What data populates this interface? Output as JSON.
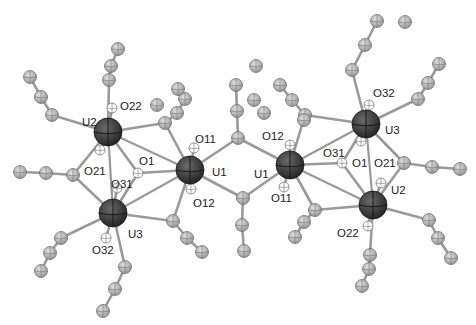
{
  "colors": {
    "uranium": "#3a3a3a",
    "carbon": "#b5b5b5",
    "oxygen": "#ffffff",
    "bond": "#9a9a9a",
    "label": "#222222"
  },
  "atoms": [
    {
      "id": "U2a",
      "el": "U",
      "x": 108,
      "y": 132
    },
    {
      "id": "U1a",
      "el": "U",
      "x": 190,
      "y": 170
    },
    {
      "id": "U3a",
      "el": "U",
      "x": 113,
      "y": 213
    },
    {
      "id": "U1b",
      "el": "U",
      "x": 290,
      "y": 165
    },
    {
      "id": "U3b",
      "el": "U",
      "x": 366,
      "y": 124
    },
    {
      "id": "U2b",
      "el": "U",
      "x": 373,
      "y": 205
    },
    {
      "id": "O1a",
      "el": "O",
      "x": 138,
      "y": 173
    },
    {
      "id": "O21a",
      "el": "O",
      "x": 100,
      "y": 150
    },
    {
      "id": "O22a",
      "el": "O",
      "x": 112,
      "y": 108
    },
    {
      "id": "O31a",
      "el": "O",
      "x": 117,
      "y": 188
    },
    {
      "id": "O32a",
      "el": "O",
      "x": 106,
      "y": 238
    },
    {
      "id": "O11a",
      "el": "O",
      "x": 194,
      "y": 148
    },
    {
      "id": "O12a",
      "el": "O",
      "x": 191,
      "y": 189
    },
    {
      "id": "O1b",
      "el": "O",
      "x": 342,
      "y": 163
    },
    {
      "id": "O31b",
      "el": "O",
      "x": 361,
      "y": 141
    },
    {
      "id": "O32b",
      "el": "O",
      "x": 369,
      "y": 105
    },
    {
      "id": "O21b",
      "el": "O",
      "x": 381,
      "y": 183
    },
    {
      "id": "O22b",
      "el": "O",
      "x": 368,
      "y": 226
    },
    {
      "id": "O11b",
      "el": "O",
      "x": 284,
      "y": 187
    },
    {
      "id": "O12b",
      "el": "O",
      "x": 290,
      "y": 145
    },
    {
      "id": "Cb1",
      "el": "C",
      "x": 238,
      "y": 138
    },
    {
      "id": "Cb2",
      "el": "C",
      "x": 237,
      "y": 111
    },
    {
      "id": "Cb3",
      "el": "C",
      "x": 236,
      "y": 85
    },
    {
      "id": "Cb4",
      "el": "C",
      "x": 243,
      "y": 198
    },
    {
      "id": "Cb5",
      "el": "C",
      "x": 242,
      "y": 225
    },
    {
      "id": "Cb6",
      "el": "C",
      "x": 244,
      "y": 251
    },
    {
      "id": "Ca1",
      "el": "C",
      "x": 52,
      "y": 115
    },
    {
      "id": "Ca2",
      "el": "C",
      "x": 41,
      "y": 97
    },
    {
      "id": "Ca3",
      "el": "C",
      "x": 30,
      "y": 77
    },
    {
      "id": "Ca4",
      "el": "C",
      "x": 109,
      "y": 80
    },
    {
      "id": "Ca5",
      "el": "C",
      "x": 111,
      "y": 66
    },
    {
      "id": "Ca6",
      "el": "C",
      "x": 118,
      "y": 49
    },
    {
      "id": "Ca7",
      "el": "C",
      "x": 165,
      "y": 123
    },
    {
      "id": "Ca8",
      "el": "C",
      "x": 177,
      "y": 113
    },
    {
      "id": "Ca9",
      "el": "C",
      "x": 185,
      "y": 99
    },
    {
      "id": "Ca10",
      "el": "C",
      "x": 73,
      "y": 175
    },
    {
      "id": "Ca11",
      "el": "C",
      "x": 46,
      "y": 173
    },
    {
      "id": "Ca12",
      "el": "C",
      "x": 20,
      "y": 172
    },
    {
      "id": "Ca13",
      "el": "C",
      "x": 61,
      "y": 238
    },
    {
      "id": "Ca14",
      "el": "C",
      "x": 50,
      "y": 253
    },
    {
      "id": "Ca15",
      "el": "C",
      "x": 41,
      "y": 271
    },
    {
      "id": "Ca16",
      "el": "C",
      "x": 125,
      "y": 267
    },
    {
      "id": "Ca17",
      "el": "C",
      "x": 115,
      "y": 289
    },
    {
      "id": "Ca18",
      "el": "C",
      "x": 103,
      "y": 311
    },
    {
      "id": "Ca19",
      "el": "C",
      "x": 173,
      "y": 221
    },
    {
      "id": "Ca20",
      "el": "C",
      "x": 187,
      "y": 238
    },
    {
      "id": "Ca21",
      "el": "C",
      "x": 202,
      "y": 252
    },
    {
      "id": "Ca22",
      "el": "C",
      "x": 157,
      "y": 105
    },
    {
      "id": "Ca23",
      "el": "C",
      "x": 178,
      "y": 89
    },
    {
      "id": "Cc1",
      "el": "C",
      "x": 305,
      "y": 115
    },
    {
      "id": "Cc2",
      "el": "C",
      "x": 292,
      "y": 100
    },
    {
      "id": "Cc3",
      "el": "C",
      "x": 280,
      "y": 85
    },
    {
      "id": "Cc4",
      "el": "C",
      "x": 352,
      "y": 70
    },
    {
      "id": "Cc5",
      "el": "C",
      "x": 365,
      "y": 45
    },
    {
      "id": "Cc6",
      "el": "C",
      "x": 377,
      "y": 21
    },
    {
      "id": "Cc7",
      "el": "C",
      "x": 418,
      "y": 99
    },
    {
      "id": "Cc8",
      "el": "C",
      "x": 428,
      "y": 83
    },
    {
      "id": "Cc9",
      "el": "C",
      "x": 439,
      "y": 64
    },
    {
      "id": "Cc10",
      "el": "C",
      "x": 404,
      "y": 163
    },
    {
      "id": "Cc11",
      "el": "C",
      "x": 432,
      "y": 167
    },
    {
      "id": "Cc12",
      "el": "C",
      "x": 460,
      "y": 169
    },
    {
      "id": "Cc13",
      "el": "C",
      "x": 429,
      "y": 220
    },
    {
      "id": "Cc14",
      "el": "C",
      "x": 438,
      "y": 238
    },
    {
      "id": "Cc15",
      "el": "C",
      "x": 451,
      "y": 258
    },
    {
      "id": "Cc16",
      "el": "C",
      "x": 370,
      "y": 255
    },
    {
      "id": "Cc17",
      "el": "C",
      "x": 369,
      "y": 269
    },
    {
      "id": "Cc18",
      "el": "C",
      "x": 362,
      "y": 286
    },
    {
      "id": "Cc19",
      "el": "C",
      "x": 315,
      "y": 210
    },
    {
      "id": "Cc20",
      "el": "C",
      "x": 304,
      "y": 222
    },
    {
      "id": "Cc21",
      "el": "C",
      "x": 295,
      "y": 237
    },
    {
      "id": "Cc22",
      "el": "C",
      "x": 304,
      "y": 120
    },
    {
      "id": "Cc23",
      "el": "C",
      "x": 254,
      "y": 100
    },
    {
      "id": "Cc24",
      "el": "C",
      "x": 264,
      "y": 113
    },
    {
      "id": "Cc25",
      "el": "C",
      "x": 256,
      "y": 66
    },
    {
      "id": "Cc26",
      "el": "C",
      "x": 405,
      "y": 22
    }
  ],
  "bonds": [
    [
      "U2a",
      "U1a"
    ],
    [
      "U2a",
      "U3a"
    ],
    [
      "U3a",
      "U1a"
    ],
    [
      "U2a",
      "O1a"
    ],
    [
      "U3a",
      "O1a"
    ],
    [
      "U1a",
      "O1a"
    ],
    [
      "U2a",
      "O21a"
    ],
    [
      "U2a",
      "O22a"
    ],
    [
      "U3a",
      "O31a"
    ],
    [
      "U3a",
      "O32a"
    ],
    [
      "U1a",
      "O11a"
    ],
    [
      "U1a",
      "O12a"
    ],
    [
      "U1a",
      "Cb1"
    ],
    [
      "Cb1",
      "U1b"
    ],
    [
      "U1a",
      "Cb4"
    ],
    [
      "Cb4",
      "U1b"
    ],
    [
      "Cb1",
      "Cb2"
    ],
    [
      "Cb2",
      "Cb3"
    ],
    [
      "Cb4",
      "Cb5"
    ],
    [
      "Cb5",
      "Cb6"
    ],
    [
      "U2a",
      "Ca1"
    ],
    [
      "Ca1",
      "Ca2"
    ],
    [
      "Ca2",
      "Ca3"
    ],
    [
      "U2a",
      "Ca4"
    ],
    [
      "Ca4",
      "Ca5"
    ],
    [
      "Ca5",
      "Ca6"
    ],
    [
      "U2a",
      "Ca7"
    ],
    [
      "Ca7",
      "U1a"
    ],
    [
      "Ca7",
      "Ca8"
    ],
    [
      "Ca8",
      "Ca9"
    ],
    [
      "U2a",
      "Ca10"
    ],
    [
      "U3a",
      "Ca10"
    ],
    [
      "Ca10",
      "Ca11"
    ],
    [
      "Ca11",
      "Ca12"
    ],
    [
      "U3a",
      "Ca13"
    ],
    [
      "Ca13",
      "Ca14"
    ],
    [
      "Ca14",
      "Ca15"
    ],
    [
      "U3a",
      "Ca16"
    ],
    [
      "Ca16",
      "Ca17"
    ],
    [
      "Ca17",
      "Ca18"
    ],
    [
      "U3a",
      "Ca19"
    ],
    [
      "Ca19",
      "U1a"
    ],
    [
      "Ca19",
      "Ca20"
    ],
    [
      "Ca20",
      "Ca21"
    ],
    [
      "U1b",
      "U3b"
    ],
    [
      "U1b",
      "U2b"
    ],
    [
      "U3b",
      "U2b"
    ],
    [
      "U1b",
      "O1b"
    ],
    [
      "U3b",
      "O1b"
    ],
    [
      "U2b",
      "O1b"
    ],
    [
      "U3b",
      "O31b"
    ],
    [
      "U3b",
      "O32b"
    ],
    [
      "U2b",
      "O21b"
    ],
    [
      "U2b",
      "O22b"
    ],
    [
      "U1b",
      "O11b"
    ],
    [
      "U1b",
      "O12b"
    ],
    [
      "U1b",
      "Cc1"
    ],
    [
      "U3b",
      "Cc1"
    ],
    [
      "Cc1",
      "Cc2"
    ],
    [
      "Cc2",
      "Cc3"
    ],
    [
      "U3b",
      "Cc4"
    ],
    [
      "Cc4",
      "Cc5"
    ],
    [
      "Cc5",
      "Cc6"
    ],
    [
      "U3b",
      "Cc7"
    ],
    [
      "Cc7",
      "Cc8"
    ],
    [
      "Cc8",
      "Cc9"
    ],
    [
      "U3b",
      "Cc10"
    ],
    [
      "U2b",
      "Cc10"
    ],
    [
      "Cc10",
      "Cc11"
    ],
    [
      "Cc11",
      "Cc12"
    ],
    [
      "U2b",
      "Cc13"
    ],
    [
      "Cc13",
      "Cc14"
    ],
    [
      "Cc14",
      "Cc15"
    ],
    [
      "U2b",
      "Cc16"
    ],
    [
      "Cc16",
      "Cc17"
    ],
    [
      "Cc17",
      "Cc18"
    ],
    [
      "U2b",
      "Cc19"
    ],
    [
      "U1b",
      "Cc19"
    ],
    [
      "Cc19",
      "Cc20"
    ],
    [
      "Cc20",
      "Cc21"
    ]
  ],
  "labels": [
    {
      "text": "U2",
      "x": 82,
      "y": 126
    },
    {
      "text": "O22",
      "x": 120,
      "y": 110
    },
    {
      "text": "O21",
      "x": 84,
      "y": 175
    },
    {
      "text": "O1",
      "x": 139,
      "y": 165
    },
    {
      "text": "O31",
      "x": 111,
      "y": 188
    },
    {
      "text": "O11",
      "x": 195,
      "y": 143
    },
    {
      "text": "U1",
      "x": 212,
      "y": 176
    },
    {
      "text": "O12",
      "x": 193,
      "y": 207
    },
    {
      "text": "U3",
      "x": 128,
      "y": 238
    },
    {
      "text": "O32",
      "x": 92,
      "y": 254
    },
    {
      "text": "O12",
      "x": 262,
      "y": 140
    },
    {
      "text": "U1",
      "x": 254,
      "y": 178
    },
    {
      "text": "O11",
      "x": 271,
      "y": 202
    },
    {
      "text": "O31",
      "x": 323,
      "y": 157
    },
    {
      "text": "O1",
      "x": 352,
      "y": 167
    },
    {
      "text": "O32",
      "x": 373,
      "y": 97
    },
    {
      "text": "U3",
      "x": 385,
      "y": 134
    },
    {
      "text": "O21",
      "x": 374,
      "y": 167
    },
    {
      "text": "U2",
      "x": 391,
      "y": 194
    },
    {
      "text": "O22",
      "x": 337,
      "y": 237
    }
  ]
}
